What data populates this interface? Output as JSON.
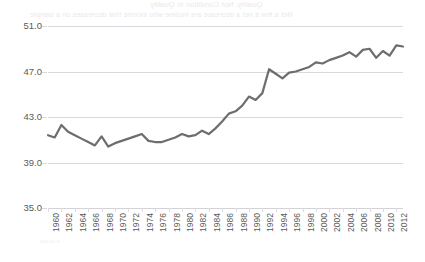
{
  "page": {
    "background_color": "#ffffff",
    "bleed_through_text": {
      "title": "Quality, Not Condition in Quality",
      "subtitle": "Net a few a net a decrease are income who income that decreases on a sample",
      "footer": "a noted"
    }
  },
  "chart_data": {
    "type": "line",
    "title": "",
    "subtitle": "",
    "xlabel": "",
    "ylabel": "",
    "grid": true,
    "legend": "none",
    "line_color": "#6d6d6d",
    "line_width": 2.2,
    "gridline_color": "#d9d9de",
    "axis_color": "#d2d2d7",
    "tick_label_color": "#5a5a5a",
    "ylim": [
      35.0,
      51.0
    ],
    "yticks": [
      35.0,
      39.0,
      43.0,
      47.0,
      51.0
    ],
    "ytick_labels": [
      "35.0",
      "39.0",
      "43.0",
      "47.0",
      "51.0"
    ],
    "xlim": [
      1960,
      2013
    ],
    "xticks": [
      1960,
      1962,
      1964,
      1966,
      1968,
      1970,
      1972,
      1974,
      1976,
      1978,
      1980,
      1982,
      1984,
      1986,
      1988,
      1990,
      1992,
      1994,
      1996,
      1998,
      2000,
      2002,
      2004,
      2006,
      2008,
      2010,
      2012
    ],
    "xtick_labels": [
      "1960",
      "1962",
      "1964",
      "1966",
      "1968",
      "1970",
      "1972",
      "1974",
      "1976",
      "1978",
      "1980",
      "1982",
      "1984",
      "1986",
      "1988",
      "1990",
      "1992",
      "1994",
      "1996",
      "1998",
      "2000",
      "2002",
      "2004",
      "2006",
      "2008",
      "2010",
      "2012"
    ],
    "x": [
      1960,
      1961,
      1962,
      1963,
      1964,
      1965,
      1966,
      1967,
      1968,
      1969,
      1970,
      1971,
      1972,
      1973,
      1974,
      1975,
      1976,
      1977,
      1978,
      1979,
      1980,
      1981,
      1982,
      1983,
      1984,
      1985,
      1986,
      1987,
      1988,
      1989,
      1990,
      1991,
      1992,
      1993,
      1994,
      1995,
      1996,
      1997,
      1998,
      1999,
      2000,
      2001,
      2002,
      2003,
      2004,
      2005,
      2006,
      2007,
      2008,
      2009,
      2010,
      2011,
      2012,
      2013
    ],
    "values": [
      41.4,
      41.2,
      42.3,
      41.7,
      41.4,
      41.1,
      40.8,
      40.5,
      41.3,
      40.4,
      40.7,
      40.9,
      41.1,
      41.3,
      41.5,
      40.9,
      40.8,
      40.8,
      41.0,
      41.2,
      41.5,
      41.3,
      41.4,
      41.8,
      41.5,
      42.0,
      42.6,
      43.3,
      43.5,
      44.0,
      44.8,
      44.5,
      45.1,
      47.2,
      46.8,
      46.4,
      46.9,
      47.0,
      47.2,
      47.4,
      47.8,
      47.7,
      48.0,
      48.2,
      48.4,
      48.7,
      48.3,
      48.9,
      49.0,
      48.2,
      48.8,
      48.4,
      49.3,
      49.2
    ]
  }
}
